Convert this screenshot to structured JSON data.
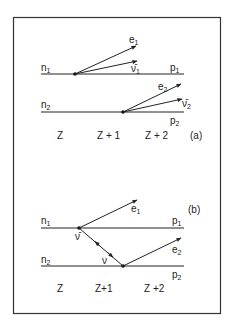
{
  "figure": {
    "frame_color": "#333333",
    "line_color": "#222222"
  },
  "panel_a": {
    "tag": "(a)",
    "rows": [
      {
        "left": "n",
        "left_sub": "1",
        "right": "p",
        "right_sub": "1"
      },
      {
        "left": "n",
        "left_sub": "2",
        "right": "p",
        "right_sub": "2"
      }
    ],
    "vectors": [
      {
        "label": "e",
        "sub": "1"
      },
      {
        "label": "ν̄",
        "sub": "1"
      },
      {
        "label": "e",
        "sub": "2"
      },
      {
        "label": "ν̄",
        "sub": "2"
      }
    ],
    "axis_labels": [
      "Z",
      "Z + 1",
      "Z + 2"
    ]
  },
  "panel_b": {
    "tag": "(b)",
    "rows": [
      {
        "left": "n",
        "left_sub": "1",
        "right": "p",
        "right_sub": "1"
      },
      {
        "left": "n",
        "left_sub": "2",
        "right": "p",
        "right_sub": "2"
      }
    ],
    "vectors": [
      {
        "label": "e",
        "sub": "1"
      },
      {
        "label": "e",
        "sub": "2"
      },
      {
        "label": "ν̄"
      },
      {
        "label": "ν"
      }
    ],
    "axis_labels": [
      "Z",
      "Z+1",
      "Z +2"
    ]
  }
}
